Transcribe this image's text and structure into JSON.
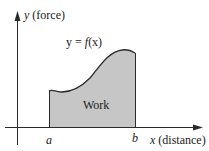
{
  "diagram": {
    "y_axis_label": "(force)",
    "y_axis_var": "y",
    "x_axis_label": "(distance)",
    "x_axis_var": "x",
    "curve_label": {
      "lhs": "y",
      "eq": " = ",
      "f": "f",
      "arg": "(x)"
    },
    "region_label": "Work",
    "lower_bound": "a",
    "upper_bound": "b"
  },
  "colors": {
    "fill": "#c6c6c6",
    "stroke": "#2a2a2a",
    "background": "#ffffff"
  }
}
